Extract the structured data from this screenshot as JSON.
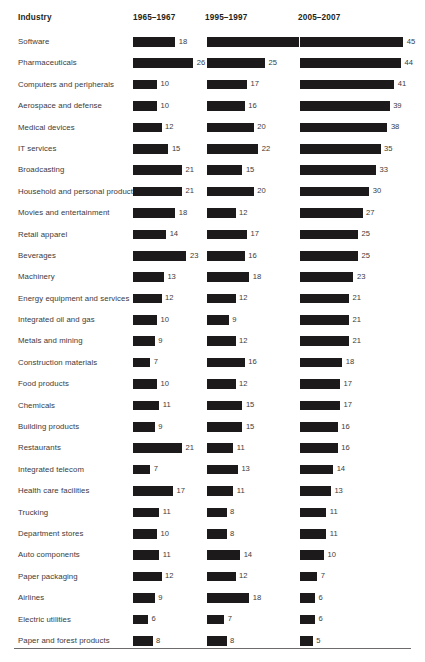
{
  "chart_data": {
    "type": "bar",
    "title": "",
    "xlabel": "",
    "ylabel": "Industry",
    "grid": false,
    "legend_position": "none",
    "orientation": "horizontal",
    "value_labels": true,
    "xlim": [
      0,
      45
    ],
    "categories_label": "Industry",
    "series": [
      {
        "name": "1965–1967",
        "values": [
          18,
          26,
          10,
          10,
          12,
          15,
          21,
          21,
          18,
          14,
          23,
          13,
          12,
          10,
          9,
          7,
          10,
          11,
          9,
          21,
          7,
          17,
          11,
          10,
          11,
          12,
          9,
          6,
          8
        ]
      },
      {
        "name": "1995–1997",
        "values": [
          40,
          25,
          17,
          16,
          20,
          22,
          15,
          20,
          12,
          17,
          16,
          18,
          12,
          9,
          12,
          16,
          12,
          15,
          15,
          11,
          13,
          11,
          8,
          8,
          14,
          12,
          18,
          7,
          8
        ]
      },
      {
        "name": "2005–2007",
        "values": [
          45,
          44,
          41,
          39,
          38,
          35,
          33,
          30,
          27,
          25,
          25,
          23,
          21,
          21,
          21,
          18,
          17,
          17,
          16,
          16,
          14,
          13,
          11,
          11,
          10,
          7,
          6,
          6,
          5
        ]
      }
    ],
    "categories": [
      "Software",
      "Pharmaceuticals",
      "Computers and peripherals",
      "Aerospace and defense",
      "Medical devices",
      "IT services",
      "Broadcasting",
      "Household and personal products",
      "Movies and entertainment",
      "Retail apparel",
      "Beverages",
      "Machinery",
      "Energy equipment and services",
      "Integrated oil and gas",
      "Metals and mining",
      "Construction materials",
      "Food products",
      "Chemicals",
      "Building products",
      "Restaurants",
      "Integrated telecom",
      "Health care facilities",
      "Trucking",
      "Department stores",
      "Auto components",
      "Paper packaging",
      "Airlines",
      "Electric utilities",
      "Paper and forest products"
    ]
  },
  "table": {
    "headers": {
      "industry": "Industry",
      "col1": "1965–1967",
      "col2": "1995–1997",
      "col3": "2005–2007"
    },
    "rows": [
      {
        "industry": "Software",
        "v1": 18,
        "v2": 40,
        "v3": 45
      },
      {
        "industry": "Pharmaceuticals",
        "v1": 26,
        "v2": 25,
        "v3": 44
      },
      {
        "industry": "Computers and peripherals",
        "v1": 10,
        "v2": 17,
        "v3": 41
      },
      {
        "industry": "Aerospace and defense",
        "v1": 10,
        "v2": 16,
        "v3": 39
      },
      {
        "industry": "Medical devices",
        "v1": 12,
        "v2": 20,
        "v3": 38
      },
      {
        "industry": "IT services",
        "v1": 15,
        "v2": 22,
        "v3": 35
      },
      {
        "industry": "Broadcasting",
        "v1": 21,
        "v2": 15,
        "v3": 33
      },
      {
        "industry": "Household and personal products",
        "v1": 21,
        "v2": 20,
        "v3": 30
      },
      {
        "industry": "Movies and entertainment",
        "v1": 18,
        "v2": 12,
        "v3": 27
      },
      {
        "industry": "Retail apparel",
        "v1": 14,
        "v2": 17,
        "v3": 25
      },
      {
        "industry": "Beverages",
        "v1": 23,
        "v2": 16,
        "v3": 25
      },
      {
        "industry": "Machinery",
        "v1": 13,
        "v2": 18,
        "v3": 23
      },
      {
        "industry": "Energy equipment and services",
        "v1": 12,
        "v2": 12,
        "v3": 21
      },
      {
        "industry": "Integrated oil and gas",
        "v1": 10,
        "v2": 9,
        "v3": 21
      },
      {
        "industry": "Metals and mining",
        "v1": 9,
        "v2": 12,
        "v3": 21
      },
      {
        "industry": "Construction materials",
        "v1": 7,
        "v2": 16,
        "v3": 18
      },
      {
        "industry": "Food products",
        "v1": 10,
        "v2": 12,
        "v3": 17
      },
      {
        "industry": "Chemicals",
        "v1": 11,
        "v2": 15,
        "v3": 17
      },
      {
        "industry": "Building products",
        "v1": 9,
        "v2": 15,
        "v3": 16
      },
      {
        "industry": "Restaurants",
        "v1": 21,
        "v2": 11,
        "v3": 16
      },
      {
        "industry": "Integrated telecom",
        "v1": 7,
        "v2": 13,
        "v3": 14
      },
      {
        "industry": "Health care facilities",
        "v1": 17,
        "v2": 11,
        "v3": 13
      },
      {
        "industry": "Trucking",
        "v1": 11,
        "v2": 8,
        "v3": 11
      },
      {
        "industry": "Department stores",
        "v1": 10,
        "v2": 8,
        "v3": 11
      },
      {
        "industry": "Auto components",
        "v1": 11,
        "v2": 14,
        "v3": 10
      },
      {
        "industry": "Paper packaging",
        "v1": 12,
        "v2": 12,
        "v3": 7
      },
      {
        "industry": "Airlines",
        "v1": 9,
        "v2": 18,
        "v3": 6
      },
      {
        "industry": "Electric utilities",
        "v1": 6,
        "v2": 7,
        "v3": 6
      },
      {
        "industry": "Paper and forest products",
        "v1": 8,
        "v2": 8,
        "v3": 5
      }
    ]
  },
  "style": {
    "bar_color": "#1c1a1b",
    "text_color": "#3c3a3b",
    "header_color": "#231f20",
    "rule_color": "#6e6b6c",
    "background": "#ffffff",
    "px_per_unit": 2.26
  }
}
